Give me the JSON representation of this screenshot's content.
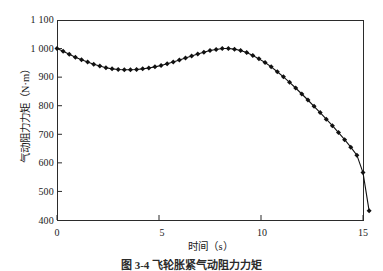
{
  "figure": {
    "caption": "图 3-4  飞轮胀紧气动阻力力矩"
  },
  "chart_data": {
    "type": "line",
    "title": "",
    "xlabel": "时间（s）",
    "ylabel": "气动阻力力矩（N·m）",
    "xlim": [
      0,
      15
    ],
    "ylim": [
      400,
      1100
    ],
    "xticks": [
      "0",
      "5",
      "10",
      "15"
    ],
    "xtick_values": [
      0,
      5,
      10,
      15
    ],
    "yticks": [
      "400",
      "500",
      "600",
      "700",
      "800",
      "900",
      "1 000",
      "1 100"
    ],
    "ytick_values": [
      400,
      500,
      600,
      700,
      800,
      900,
      1000,
      1100
    ],
    "grid": false,
    "legend": null,
    "marker": "diamond",
    "marker_color": "#111111",
    "line_color": "#111111",
    "series": [
      {
        "name": "气动阻力力矩",
        "x": [
          0.0,
          0.3,
          0.6,
          0.9,
          1.2,
          1.5,
          1.8,
          2.1,
          2.4,
          2.7,
          3.0,
          3.3,
          3.6,
          3.9,
          4.2,
          4.5,
          4.8,
          5.1,
          5.4,
          5.7,
          6.0,
          6.3,
          6.6,
          6.9,
          7.2,
          7.5,
          7.8,
          8.1,
          8.4,
          8.7,
          9.0,
          9.3,
          9.6,
          9.9,
          10.2,
          10.5,
          10.8,
          11.1,
          11.4,
          11.7,
          12.0,
          12.3,
          12.6,
          12.9,
          13.2,
          13.5,
          13.8,
          14.1,
          14.4,
          14.7,
          15.0,
          15.3
        ],
        "y": [
          1000,
          991,
          980,
          970,
          961,
          953,
          945,
          939,
          933,
          929,
          927,
          926,
          926,
          927,
          929,
          932,
          936,
          941,
          947,
          953,
          960,
          967,
          974,
          981,
          987,
          993,
          997,
          1000,
          1000,
          998,
          993,
          986,
          976,
          964,
          951,
          936,
          919,
          901,
          882,
          862,
          841,
          820,
          798,
          776,
          753,
          730,
          706,
          681,
          655,
          627,
          566,
          432
        ]
      }
    ]
  }
}
